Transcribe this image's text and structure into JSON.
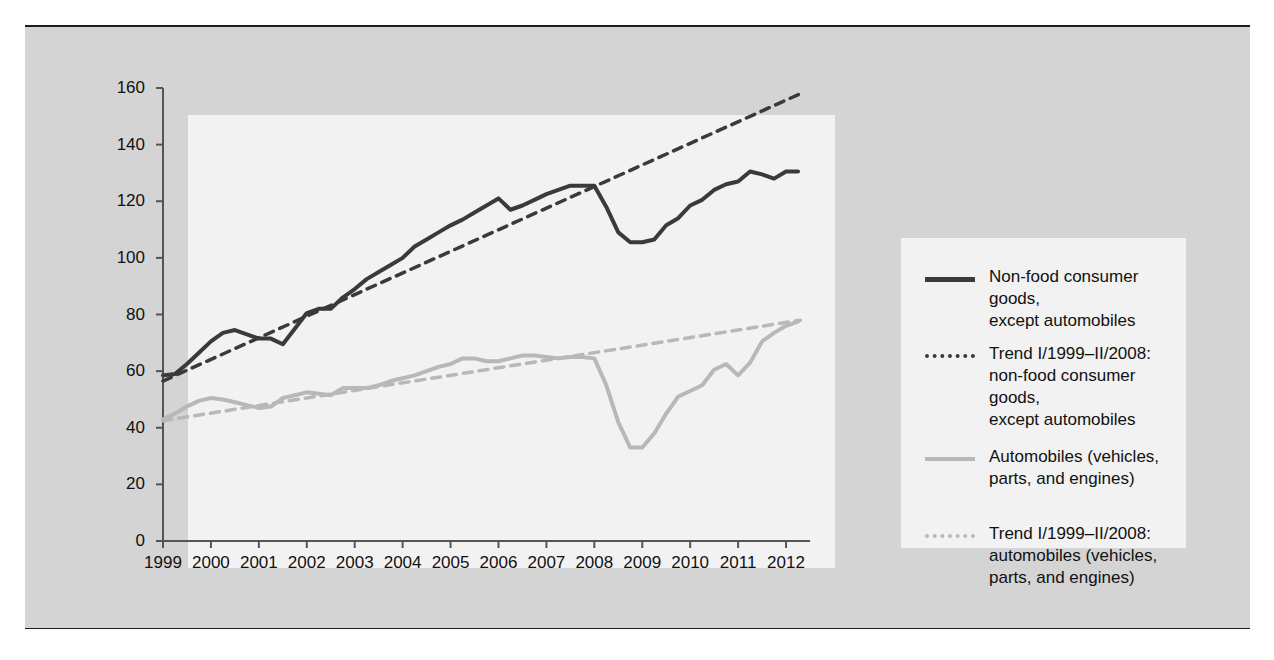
{
  "figure": {
    "background_color": "#d4d4d4",
    "plot_background_color": "#f2f2f2",
    "rule_color": "#1c1c1c"
  },
  "chart_data": {
    "type": "line",
    "title": "",
    "subtitle": "",
    "xlabel": "",
    "ylabel": "",
    "xlim": [
      1999,
      2012.5
    ],
    "ylim": [
      0,
      160
    ],
    "grid": false,
    "legend_position": "right",
    "ytick_labels": [
      "160",
      "140",
      "120",
      "100",
      "80",
      "60",
      "40",
      "20",
      "0"
    ],
    "ytick_values": [
      160,
      140,
      120,
      100,
      80,
      60,
      40,
      20,
      0
    ],
    "xtick_labels": [
      "1999",
      "2000",
      "2001",
      "2002",
      "2003",
      "2004",
      "2005",
      "2006",
      "2007",
      "2008",
      "2009",
      "2010",
      "2011",
      "2012"
    ],
    "xtick_values": [
      1999,
      2000,
      2001,
      2002,
      2003,
      2004,
      2005,
      2006,
      2007,
      2008,
      2009,
      2010,
      2011,
      2012
    ],
    "colors": {
      "nonfood": "#3a3a3a",
      "nonfood_trend": "#3a3a3a",
      "automobiles": "#b8b8b8",
      "automobiles_trend": "#b8b8b8"
    },
    "series": [
      {
        "name": "Non-food consumer goods, except automobiles",
        "style": "solid",
        "color": "#3a3a3a",
        "x": [
          1999.0,
          1999.25,
          1999.5,
          1999.75,
          2000.0,
          2000.25,
          2000.5,
          2000.75,
          2001.0,
          2001.25,
          2001.5,
          2001.75,
          2002.0,
          2002.25,
          2002.5,
          2002.75,
          2003.0,
          2003.25,
          2003.5,
          2003.75,
          2004.0,
          2004.25,
          2004.5,
          2004.75,
          2005.0,
          2005.25,
          2005.5,
          2005.75,
          2006.0,
          2006.25,
          2006.5,
          2006.75,
          2007.0,
          2007.25,
          2007.5,
          2007.75,
          2008.0,
          2008.25,
          2008.5,
          2008.75,
          2009.0,
          2009.25,
          2009.5,
          2009.75,
          2010.0,
          2010.25,
          2010.5,
          2010.75,
          2011.0,
          2011.25,
          2011.5,
          2011.75,
          2012.0,
          2012.25
        ],
        "y": [
          58.5,
          59.0,
          62.5,
          66.5,
          70.5,
          73.5,
          74.5,
          73.0,
          71.5,
          71.5,
          69.5,
          75.0,
          80.5,
          82.0,
          82.0,
          86.0,
          89.0,
          92.5,
          95.0,
          97.5,
          100.0,
          104.0,
          106.5,
          109.0,
          111.5,
          113.5,
          116.0,
          118.5,
          121.0,
          117.0,
          118.5,
          120.5,
          122.5,
          124.0,
          125.5,
          125.5,
          125.5,
          118.0,
          109.0,
          105.5,
          105.5,
          106.5,
          111.5,
          114.0,
          118.5,
          120.5,
          124.0,
          126.0,
          127.0,
          130.5,
          129.5,
          128.0,
          130.5,
          130.5
        ]
      },
      {
        "name": "Trend I/1999–II/2008: non-food consumer goods, except automobiles",
        "style": "dashed",
        "color": "#3a3a3a",
        "x": [
          1999.0,
          2012.3
        ],
        "y": [
          56.5,
          158.0
        ]
      },
      {
        "name": "Automobiles (vehicles, parts, and engines)",
        "style": "solid",
        "color": "#b8b8b8",
        "x": [
          1999.0,
          1999.25,
          1999.5,
          1999.75,
          2000.0,
          2000.25,
          2000.5,
          2000.75,
          2001.0,
          2001.25,
          2001.5,
          2001.75,
          2002.0,
          2002.25,
          2002.5,
          2002.75,
          2003.0,
          2003.25,
          2003.5,
          2003.75,
          2004.0,
          2004.25,
          2004.5,
          2004.75,
          2005.0,
          2005.25,
          2005.5,
          2005.75,
          2006.0,
          2006.25,
          2006.5,
          2006.75,
          2007.0,
          2007.25,
          2007.5,
          2007.75,
          2008.0,
          2008.25,
          2008.5,
          2008.75,
          2009.0,
          2009.25,
          2009.5,
          2009.75,
          2010.0,
          2010.25,
          2010.5,
          2010.75,
          2011.0,
          2011.25,
          2011.5,
          2011.75,
          2012.0,
          2012.25
        ],
        "y": [
          43.0,
          45.0,
          47.5,
          49.5,
          50.5,
          50.0,
          49.0,
          48.0,
          47.0,
          47.5,
          50.5,
          51.5,
          52.5,
          52.0,
          51.5,
          54.0,
          54.0,
          54.0,
          55.0,
          56.5,
          57.5,
          58.5,
          60.0,
          61.5,
          62.5,
          64.5,
          64.5,
          63.5,
          63.5,
          64.5,
          65.5,
          65.5,
          65.0,
          64.5,
          65.0,
          65.0,
          64.5,
          55.0,
          42.0,
          33.0,
          33.0,
          38.0,
          45.0,
          51.0,
          53.0,
          55.0,
          60.5,
          62.5,
          58.5,
          63.0,
          70.5,
          73.5,
          76.0,
          77.5
        ]
      },
      {
        "name": "Trend I/1999–II/2008: automobiles (vehicles, parts, and engines)",
        "style": "dashed",
        "color": "#b8b8b8",
        "x": [
          1999.0,
          2012.3
        ],
        "y": [
          42.5,
          78.0
        ]
      }
    ]
  },
  "legend": {
    "entries": [
      {
        "label": "Non-food consumer goods,\nexcept automobiles",
        "style": "solid",
        "color": "#3a3a3a",
        "icon": "solid-dark-line-icon"
      },
      {
        "label": "Trend I/1999–II/2008:\nnon-food consumer goods,\nexcept automobiles",
        "style": "dashed",
        "color": "#3a3a3a",
        "icon": "dashed-dark-line-icon"
      },
      {
        "label": "Automobiles (vehicles,\nparts, and engines)",
        "style": "solid",
        "color": "#b8b8b8",
        "icon": "solid-gray-line-icon"
      },
      {
        "label": "Trend I/1999–II/2008:\nautomobiles (vehicles,\nparts, and engines)",
        "style": "dashed",
        "color": "#b8b8b8",
        "icon": "dashed-gray-line-icon"
      }
    ]
  }
}
